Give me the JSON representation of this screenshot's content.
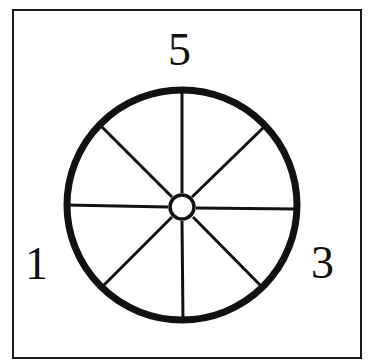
{
  "diagram": {
    "labels": {
      "top": "5",
      "left": "1",
      "right": "3"
    },
    "wheel": {
      "spokes": 8,
      "rim_color": "#111111",
      "spoke_color": "#111111",
      "hub_fill": "#ffffff"
    },
    "frame_color": "#1a1a1a"
  }
}
